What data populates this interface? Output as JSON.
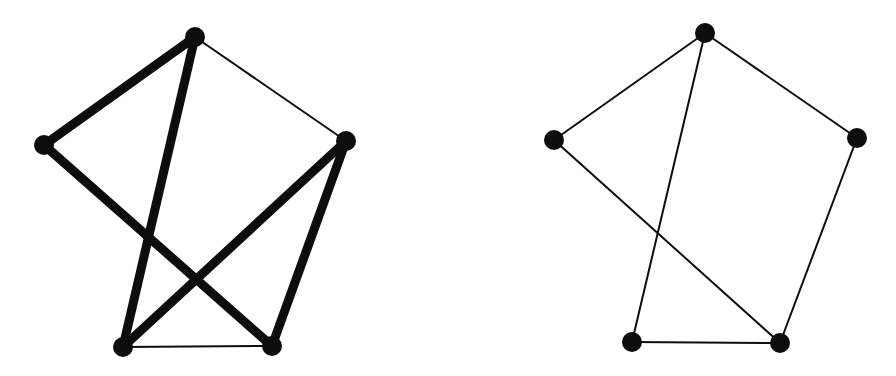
{
  "figure": {
    "width": 896,
    "height": 376,
    "background_color": "#ffffff",
    "ink_color": "#0d0d0d"
  },
  "chart_data": {
    "type": "diagram",
    "subtype": "node-link-graph-pair",
    "xlabel": "",
    "ylabel": "",
    "grid": false,
    "legend": "none",
    "axis_ranges": {
      "x": [
        0,
        896
      ],
      "y": [
        0,
        376
      ]
    },
    "graphs": [
      {
        "name": "left-graph",
        "label": "",
        "vertex_color": "#0d0d0d",
        "edge_color": "#0d0d0d",
        "vertex_radius": 10,
        "vertex_count": 5,
        "edge_count": 7,
        "crossing_count": 2,
        "nodes": [
          {
            "id": "L-top",
            "x": 195,
            "y": 37,
            "r": 10,
            "degree": 3
          },
          {
            "id": "L-left",
            "x": 44,
            "y": 145,
            "r": 10,
            "degree": 2
          },
          {
            "id": "L-right",
            "x": 346,
            "y": 141,
            "r": 10,
            "degree": 3
          },
          {
            "id": "L-bottom-left",
            "x": 123,
            "y": 347,
            "r": 10,
            "degree": 3
          },
          {
            "id": "L-bottom-right",
            "x": 272,
            "y": 346,
            "r": 10,
            "degree": 3
          }
        ],
        "edges": [
          {
            "from": "L-top",
            "to": "L-left",
            "width": 9,
            "weight": "thick"
          },
          {
            "from": "L-top",
            "to": "L-right",
            "width": 2,
            "weight": "thin"
          },
          {
            "from": "L-top",
            "to": "L-bottom-left",
            "width": 9,
            "weight": "thick"
          },
          {
            "from": "L-left",
            "to": "L-bottom-right",
            "width": 9,
            "weight": "thick"
          },
          {
            "from": "L-right",
            "to": "L-bottom-left",
            "width": 9,
            "weight": "thick"
          },
          {
            "from": "L-right",
            "to": "L-bottom-right",
            "width": 9,
            "weight": "thick"
          },
          {
            "from": "L-bottom-left",
            "to": "L-bottom-right",
            "width": 2,
            "weight": "thin"
          }
        ]
      },
      {
        "name": "right-graph",
        "label": "",
        "vertex_color": "#0d0d0d",
        "edge_color": "#0d0d0d",
        "vertex_radius": 10,
        "vertex_count": 5,
        "edge_count": 6,
        "crossing_count": 1,
        "nodes": [
          {
            "id": "R-top",
            "x": 705,
            "y": 33,
            "r": 10,
            "degree": 3
          },
          {
            "id": "R-left",
            "x": 554,
            "y": 140,
            "r": 10,
            "degree": 2
          },
          {
            "id": "R-right",
            "x": 857,
            "y": 138,
            "r": 10,
            "degree": 2
          },
          {
            "id": "R-bottom-left",
            "x": 632,
            "y": 342,
            "r": 10,
            "degree": 2
          },
          {
            "id": "R-bottom-right",
            "x": 780,
            "y": 343,
            "r": 10,
            "degree": 3
          }
        ],
        "edges": [
          {
            "from": "R-top",
            "to": "R-left",
            "width": 2,
            "weight": "thin"
          },
          {
            "from": "R-top",
            "to": "R-right",
            "width": 2,
            "weight": "thin"
          },
          {
            "from": "R-top",
            "to": "R-bottom-left",
            "width": 2,
            "weight": "thin"
          },
          {
            "from": "R-left",
            "to": "R-bottom-right",
            "width": 2,
            "weight": "thin"
          },
          {
            "from": "R-right",
            "to": "R-bottom-right",
            "width": 2,
            "weight": "thin"
          },
          {
            "from": "R-bottom-left",
            "to": "R-bottom-right",
            "width": 2,
            "weight": "thin"
          }
        ]
      }
    ]
  }
}
